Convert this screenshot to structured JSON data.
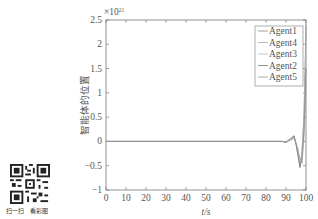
{
  "chart_data": {
    "type": "line",
    "title": "",
    "xlabel": "t/s",
    "ylabel": "智能体的位置",
    "y_multiplier": "×10^21",
    "y_multiplier_base": "×10",
    "y_multiplier_exp": "21",
    "xlim": [
      0,
      100
    ],
    "ylim": [
      -1,
      2.5
    ],
    "x_ticks": [
      "0",
      "10",
      "20",
      "30",
      "40",
      "50",
      "60",
      "70",
      "80",
      "90",
      "100"
    ],
    "y_ticks": [
      "2.5",
      "2",
      "1.5",
      "1",
      "0.5",
      "0",
      "−0.5",
      "−1"
    ],
    "grid": false,
    "legend_position": "upper right",
    "legend": [
      "Agent1",
      "Agent4",
      "Agent3",
      "Agent2",
      "Agent5"
    ],
    "series": [
      {
        "name": "Agent1",
        "x": [
          0,
          88,
          90,
          92,
          94,
          95,
          96,
          97,
          98,
          99,
          100
        ],
        "values": [
          0,
          0,
          -0.02,
          0.05,
          0.12,
          -0.05,
          -0.3,
          -0.55,
          -0.2,
          0.6,
          2.4
        ]
      },
      {
        "name": "Agent4",
        "x": [
          0,
          88,
          90,
          92,
          94,
          95,
          96,
          97,
          98,
          99,
          100
        ],
        "values": [
          0,
          0,
          -0.02,
          0.04,
          0.1,
          -0.04,
          -0.25,
          -0.5,
          -0.25,
          0.5,
          2.2
        ]
      },
      {
        "name": "Agent3",
        "x": [
          0,
          88,
          90,
          92,
          94,
          95,
          96,
          97,
          98,
          99,
          100
        ],
        "values": [
          0,
          0,
          -0.01,
          0.03,
          0.08,
          -0.02,
          -0.2,
          -0.4,
          -0.3,
          0.3,
          1.8
        ]
      },
      {
        "name": "Agent2",
        "x": [
          0,
          88,
          90,
          92,
          94,
          95,
          96,
          97,
          98,
          99,
          100
        ],
        "values": [
          0,
          0,
          -0.02,
          0.05,
          0.11,
          -0.06,
          -0.28,
          -0.52,
          -0.35,
          0.2,
          1.5
        ]
      },
      {
        "name": "Agent5",
        "x": [
          0,
          88,
          90,
          92,
          94,
          95,
          96,
          97,
          98,
          99,
          100
        ],
        "values": [
          0,
          0,
          -0.01,
          0.02,
          0.06,
          -0.03,
          -0.15,
          -0.35,
          -0.45,
          0.1,
          1.2
        ]
      }
    ]
  },
  "qr": {
    "caption_left": "扫一扫",
    "caption_right": "看彩图"
  }
}
